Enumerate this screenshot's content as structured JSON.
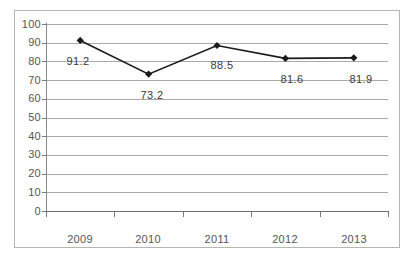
{
  "chart_data": {
    "type": "line",
    "title": "",
    "subtitle": "",
    "xlabel": "",
    "ylabel": "",
    "categories": [
      "2009",
      "2010",
      "2011",
      "2012",
      "2013"
    ],
    "values": [
      91.2,
      73.2,
      88.5,
      81.6,
      81.9
    ],
    "data_labels": [
      "91.2",
      "73.2",
      "88.5",
      "81.6",
      "81.9"
    ],
    "series": [
      {
        "name": "",
        "values": [
          91.2,
          73.2,
          88.5,
          81.6,
          81.9
        ],
        "marker": "diamond",
        "line_color": "#1a1a1a",
        "marker_color": "#1a1a1a"
      }
    ],
    "ylim": [
      0,
      100
    ],
    "ytick_step": 10,
    "y_ticks": [
      "100",
      "90",
      "80",
      "70",
      "60",
      "50",
      "40",
      "30",
      "20",
      "10",
      "0"
    ],
    "grid": {
      "horizontal": true,
      "vertical": false,
      "color": "#a9a9a9"
    },
    "legend": {
      "visible": false,
      "position": "none"
    },
    "axis_colors": {
      "y_axis": "#8a8a8a",
      "x_axis": "#6f6f6f",
      "tick_label": "#555555"
    },
    "frame": {
      "visible": true,
      "color": "#b5b5b5"
    },
    "plot_background": "#ffffff"
  }
}
